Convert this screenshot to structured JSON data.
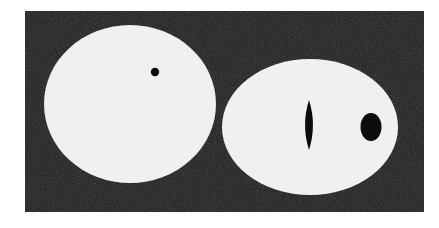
{
  "figure": {
    "title": "Scanned binary figure of two white rounded shapes with dark inclusions on a black field",
    "canvas": {
      "width": 439,
      "height": 228,
      "page_background": "#ffffff"
    },
    "plate": {
      "name": "black-field-plate",
      "x": 25,
      "y": 11,
      "width": 399,
      "height": 201,
      "color": "#0b0b0b",
      "texture": "scanned-halftone-noise"
    },
    "shapes": [
      {
        "id": "left-circle",
        "label": "Left white circle",
        "kind": "circle",
        "cx": 130,
        "cy": 104,
        "rx": 86,
        "ry": 79,
        "fill": "#ffffff"
      },
      {
        "id": "left-circle-dot",
        "label": "Small black dot inside left circle",
        "kind": "circle",
        "cx": 155,
        "cy": 72,
        "rx": 4.2,
        "ry": 4.2,
        "fill": "#0b0b0b"
      },
      {
        "id": "right-ellipse",
        "label": "Right white ellipse",
        "kind": "ellipse",
        "cx": 310,
        "cy": 127,
        "rx": 88,
        "ry": 68,
        "fill": "#ffffff"
      },
      {
        "id": "right-ellipse-slit",
        "label": "Vertical black lens-shaped slit inside right ellipse",
        "kind": "lens",
        "cx": 309,
        "cy": 125,
        "rx": 4.5,
        "ry": 25,
        "fill": "#0b0b0b"
      },
      {
        "id": "right-ellipse-oval",
        "label": "Black oval inside right ellipse",
        "kind": "ellipse",
        "cx": 371,
        "cy": 127,
        "rx": 10.5,
        "ry": 14,
        "fill": "#0b0b0b"
      }
    ],
    "colors": {
      "field": "#0b0b0b",
      "shape": "#ffffff",
      "inclusion": "#0b0b0b",
      "page": "#ffffff"
    }
  }
}
